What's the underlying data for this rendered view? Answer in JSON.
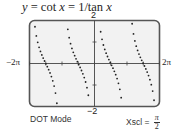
{
  "chart_data": {
    "type": "scatter",
    "title": "y = cot x = 1/tan x",
    "title_parts": {
      "lhs": "y",
      "eq1": " = cot ",
      "var": "x",
      "eq2": " = 1/tan ",
      "var2": "x"
    },
    "function": "cot(x)",
    "xlabel": "",
    "ylabel": "",
    "xlim": [
      -6.2832,
      6.2832
    ],
    "ylim": [
      -2,
      2
    ],
    "x_tick_labels": {
      "min": "−2π",
      "max": "2π"
    },
    "y_tick_labels": {
      "min": "−2",
      "max": "2"
    },
    "xscl": "π/2",
    "yscl": 1,
    "grid": false,
    "mode": "DOT Mode",
    "asymptotes": [
      -3.1416,
      0,
      3.1416
    ],
    "series": [
      {
        "name": "cot x",
        "x_range": [
          -6.2832,
          6.2832
        ],
        "style": "dots"
      }
    ]
  },
  "labels": {
    "ymax": "2",
    "ymin": "−2",
    "xmin": "−2π",
    "xmax": "2π",
    "mode": "DOT Mode",
    "xscl_prefix": "Xscl =",
    "xscl_num": "π",
    "xscl_den": "2"
  },
  "colors": {
    "frame": "#555555",
    "screen_bg": "#f2f2f2",
    "dots": "#222222",
    "axis": "#444444"
  }
}
